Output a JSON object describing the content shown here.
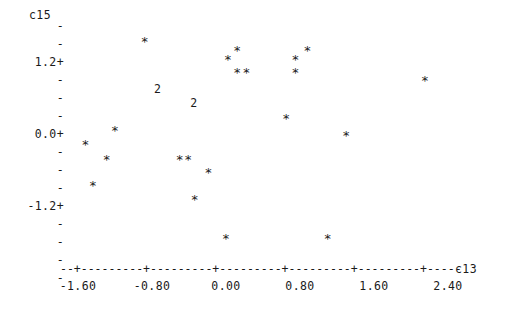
{
  "plot": {
    "type": "character-scatter",
    "y_axis_caption": "c15",
    "x_axis_caption": "c13",
    "background_color": "#ffffff",
    "ink_color": "#1a1a1a",
    "x_axis_rule": "--+---------+---------+---------+---------+---------+-----"
  },
  "y_axis": {
    "major_ticks": [
      {
        "label": "1.2+",
        "value": 1.2
      },
      {
        "label": "0.0+",
        "value": 0.0
      },
      {
        "label": "-1.2+",
        "value": -1.2
      }
    ],
    "minor_tick_glyph": "-",
    "minor_tick_count_above": 2,
    "minor_tick_count_between": 3,
    "minor_tick_count_below": 4
  },
  "x_axis": {
    "tick_labels": [
      "-1.60",
      "-0.80",
      "0.00",
      "0.80",
      "1.60",
      "2.40"
    ],
    "tick_values": [
      -1.6,
      -0.8,
      0.0,
      0.8,
      1.6,
      2.4
    ]
  },
  "chart_data": {
    "type": "scatter",
    "title": "",
    "xlabel": "c13",
    "ylabel": "c15",
    "xlim": [
      -2.0,
      2.8
    ],
    "ylim": [
      -2.1,
      1.8
    ],
    "grid": false,
    "legend": "none",
    "marker_star": "*",
    "marker_overplot_two": "2",
    "points": [
      {
        "marker": "*",
        "x": -0.88,
        "y": 1.5
      },
      {
        "marker": "*",
        "x": 0.12,
        "y": 1.35
      },
      {
        "marker": "*",
        "x": 0.88,
        "y": 1.35
      },
      {
        "marker": "*",
        "x": 0.02,
        "y": 1.2
      },
      {
        "marker": "*",
        "x": 0.75,
        "y": 1.2
      },
      {
        "marker": "*",
        "x": 0.12,
        "y": 0.98
      },
      {
        "marker": "*",
        "x": 0.22,
        "y": 0.98
      },
      {
        "marker": "*",
        "x": 0.75,
        "y": 0.98
      },
      {
        "marker": "2",
        "x": -0.74,
        "y": 0.75
      },
      {
        "marker": "2",
        "x": -0.35,
        "y": 0.52
      },
      {
        "marker": "*",
        "x": 2.15,
        "y": 0.85
      },
      {
        "marker": "*",
        "x": 0.65,
        "y": 0.22
      },
      {
        "marker": "*",
        "x": -1.2,
        "y": 0.02
      },
      {
        "marker": "*",
        "x": 1.3,
        "y": -0.07
      },
      {
        "marker": "*",
        "x": -1.52,
        "y": -0.22
      },
      {
        "marker": "*",
        "x": -1.29,
        "y": -0.46
      },
      {
        "marker": "*",
        "x": -0.5,
        "y": -0.46
      },
      {
        "marker": "*",
        "x": -0.41,
        "y": -0.46
      },
      {
        "marker": "*",
        "x": -0.19,
        "y": -0.68
      },
      {
        "marker": "*",
        "x": -1.44,
        "y": -0.9
      },
      {
        "marker": "*",
        "x": -0.34,
        "y": -1.14
      },
      {
        "marker": "*",
        "x": -0.0,
        "y": -1.78
      },
      {
        "marker": "*",
        "x": 1.1,
        "y": -1.78
      }
    ]
  }
}
